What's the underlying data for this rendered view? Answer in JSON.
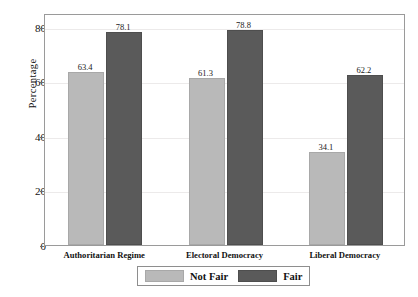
{
  "chart_data": {
    "type": "bar",
    "title": "",
    "xlabel": "",
    "ylabel": "Percentage",
    "ylim": [
      0,
      85
    ],
    "yticks": [
      0,
      20,
      40,
      60,
      80
    ],
    "ytick_labels": [
      "0",
      "20",
      "40",
      "60",
      "80"
    ],
    "grid": true,
    "legend_position": "bottom-center",
    "categories": [
      "Authoritarian Regime",
      "Electoral Democracy",
      "Liberal Democracy"
    ],
    "series": [
      {
        "name": "Not Fair",
        "color": "#b9b9b9",
        "values": [
          63.4,
          61.3,
          34.1
        ],
        "value_labels": [
          "63.4",
          "61.3",
          "34.1"
        ]
      },
      {
        "name": "Fair",
        "color": "#5a5a5a",
        "values": [
          78.1,
          78.8,
          62.2
        ],
        "value_labels": [
          "78.1",
          "78.8",
          "62.2"
        ]
      }
    ]
  },
  "axis": {
    "y_title": "Percentage"
  },
  "legend": {
    "items": [
      {
        "label": "Not Fair",
        "color": "#b9b9b9"
      },
      {
        "label": "Fair",
        "color": "#5a5a5a"
      }
    ]
  },
  "caption": {
    "text": ""
  }
}
